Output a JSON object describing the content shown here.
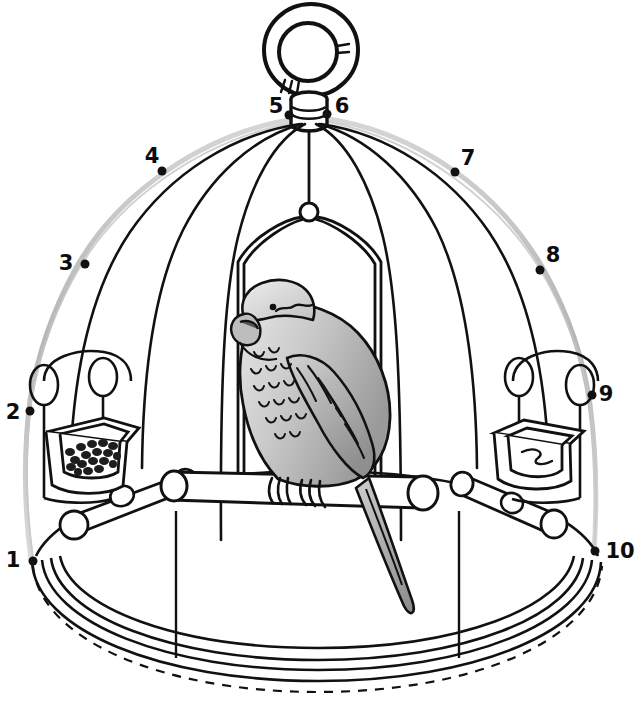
{
  "figure": {
    "type": "labeled-line-drawing",
    "background_color": "#ffffff",
    "ink_color": "#111111",
    "outer_contour_color": "#b8b8b8",
    "shading_light": "#d8d8d8",
    "shading_mid": "#b5b5b5",
    "shading_dark": "#8e8e8e"
  },
  "labels": [
    {
      "id": "1",
      "text": "1",
      "text_x": 13,
      "text_y": 567,
      "dot_x": 33,
      "dot_y": 561,
      "side": "left"
    },
    {
      "id": "2",
      "text": "2",
      "text_x": 13,
      "text_y": 419,
      "dot_x": 30,
      "dot_y": 411,
      "side": "left"
    },
    {
      "id": "3",
      "text": "3",
      "text_x": 62,
      "text_y": 270,
      "dot_x": 85,
      "dot_y": 264,
      "side": "left"
    },
    {
      "id": "4",
      "text": "4",
      "text_x": 148,
      "text_y": 163,
      "dot_x": 162,
      "dot_y": 171,
      "side": "left"
    },
    {
      "id": "5",
      "text": "5",
      "text_x": 268,
      "text_y": 115,
      "dot_x": 289,
      "dot_y": 115,
      "side": "top"
    },
    {
      "id": "6",
      "text": "6",
      "text_x": 334,
      "text_y": 115,
      "dot_x": 327,
      "dot_y": 114,
      "side": "top"
    },
    {
      "id": "7",
      "text": "7",
      "text_x": 462,
      "text_y": 166,
      "dot_x": 455,
      "dot_y": 172,
      "side": "right"
    },
    {
      "id": "8",
      "text": "8",
      "text_x": 546,
      "text_y": 262,
      "dot_x": 540,
      "dot_y": 270,
      "side": "right"
    },
    {
      "id": "9",
      "text": "9",
      "text_x": 598,
      "text_y": 401,
      "dot_x": 592,
      "dot_y": 395,
      "side": "right"
    },
    {
      "id": "10",
      "text": "10",
      "text_x": 603,
      "text_y": 558,
      "dot_x": 595,
      "dot_y": 551,
      "side": "right"
    }
  ],
  "parts": {
    "hanging_ring": "hanging-ring",
    "threaded_finial": "threaded-finial-post",
    "dome_bars": "dome-cage-bars",
    "swing": "hanging-swing",
    "swing_hook": "swing-hook",
    "seed_dish": "seed-dish",
    "water_dish": "water-dish",
    "perch_upper": "upper-perch",
    "perch_lower": "lower-perch",
    "base_tray": "base-tray",
    "bird": "parrot"
  }
}
